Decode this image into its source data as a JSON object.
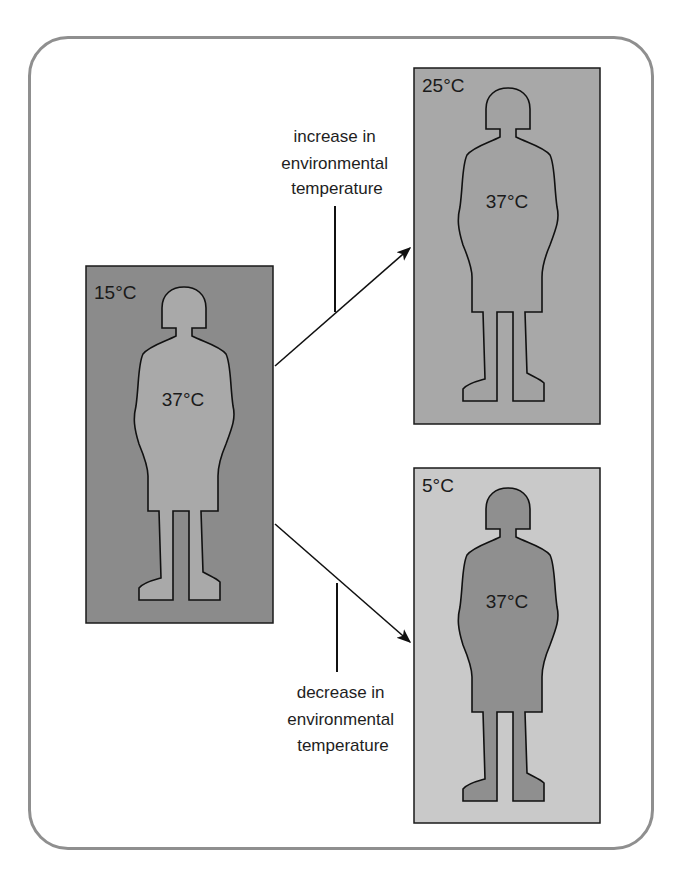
{
  "figure": {
    "panels": [
      {
        "id": "baseline",
        "ambient_temp": "15°C",
        "body_temp": "37°C",
        "box_color": "#8b8b8b",
        "body_color": "#a9a9a9"
      },
      {
        "id": "warmer",
        "ambient_temp": "25°C",
        "body_temp": "37°C",
        "box_color": "#a8a8a8",
        "body_color": "#a2a2a2"
      },
      {
        "id": "colder",
        "ambient_temp": "5°C",
        "body_temp": "37°C",
        "box_color": "#c9c9c9",
        "body_color": "#8f8f8f"
      }
    ],
    "arrows": [
      {
        "id": "increase",
        "caption_lines": [
          "increase in",
          "environmental",
          "temperature"
        ]
      },
      {
        "id": "decrease",
        "caption_lines": [
          "decrease in",
          "environmental",
          "temperature"
        ]
      }
    ]
  }
}
